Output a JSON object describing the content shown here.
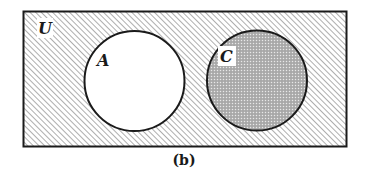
{
  "figure": {
    "caption": "(b)",
    "universe": {
      "label": "U",
      "shading": "diagonal-hatch"
    },
    "sets": [
      {
        "label": "A",
        "shading": "none"
      },
      {
        "label": "C",
        "shading": "dotted-gray"
      }
    ]
  },
  "colors": {
    "stroke": "#1a1a1a",
    "hatch": "#9a9a9a",
    "dot_fill": "#a8a8a8",
    "background": "#ffffff"
  }
}
